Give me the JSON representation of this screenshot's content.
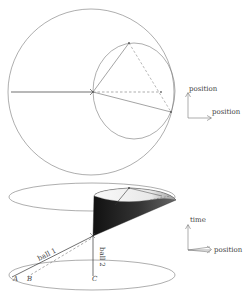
{
  "top_diagram": {
    "axis_labels": {
      "vertical": "position",
      "horizontal": "position"
    }
  },
  "bottom_diagram": {
    "axis_labels": {
      "vertical": "time",
      "horizontal": "position"
    },
    "ball_labels": {
      "ball1": "ball 1",
      "ball2": "ball 2"
    },
    "point_labels": {
      "a": "A",
      "b": "B",
      "c": "C"
    }
  },
  "colors": {
    "line": "#555555",
    "cone_dark": "#1a1a1a",
    "background": "#ffffff"
  }
}
